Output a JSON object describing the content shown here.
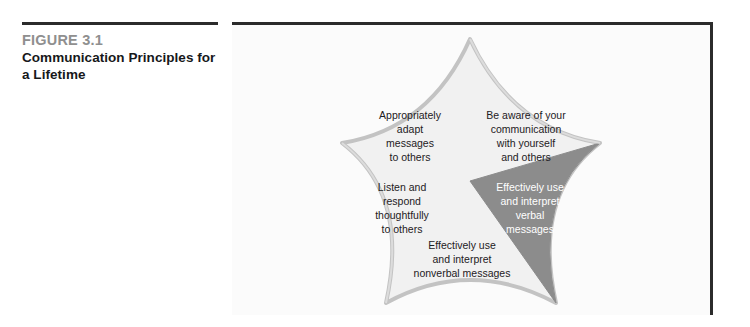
{
  "caption": {
    "figure_number": "FIGURE 3.1",
    "title": "Communication Principles\nfor a Lifetime"
  },
  "diagram": {
    "shape": "concave-pentagon",
    "colors": {
      "panel_background": "#fbfbfb",
      "pentagon_fill": "#f1f1f1",
      "pentagon_outline": "#c3c3c3",
      "highlight_wedge_fill": "#8c8c8c",
      "highlight_wedge_text": "#ffffff",
      "label_text": "#1d2023",
      "rule": "#2b2b2b"
    },
    "wedges": [
      {
        "id": "awareness",
        "position": "top-right",
        "highlighted": false,
        "label": "Be aware of your\ncommunication\nwith yourself\nand others"
      },
      {
        "id": "adapt",
        "position": "top-left",
        "highlighted": false,
        "label": "Appropriately\nadapt\nmessages\nto others"
      },
      {
        "id": "verbal",
        "position": "right",
        "highlighted": true,
        "label": "Effectively use\nand interpret\nverbal\nmessages"
      },
      {
        "id": "listen",
        "position": "left",
        "highlighted": false,
        "label": "Listen and\nrespond\nthoughtfully\nto others"
      },
      {
        "id": "nonverbal",
        "position": "bottom",
        "highlighted": false,
        "label": "Effectively use\nand interpret\nnonverbal messages"
      }
    ]
  }
}
